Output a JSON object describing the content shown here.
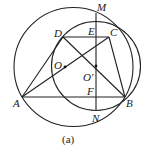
{
  "figure": {
    "caption": "(a)",
    "stroke_color": "#222222",
    "background": "#ffffff",
    "points": {
      "A": {
        "label": "A",
        "x": 22,
        "y": 97
      },
      "B": {
        "label": "B",
        "x": 125,
        "y": 97
      },
      "C": {
        "label": "C",
        "x": 109,
        "y": 37
      },
      "D": {
        "label": "D",
        "x": 63,
        "y": 37
      },
      "E": {
        "label": "E",
        "x": 96,
        "y": 37
      },
      "F": {
        "label": "F",
        "x": 96,
        "y": 97
      },
      "M": {
        "label": "M",
        "x": 96,
        "y": 13
      },
      "N": {
        "label": "N",
        "x": 96,
        "y": 111
      },
      "O": {
        "label": "O",
        "x": 65,
        "y": 67
      },
      "O_prime": {
        "label": "O′",
        "x": 96,
        "y": 66
      }
    },
    "circles": [
      {
        "name": "circle-O",
        "cx": 73.5,
        "cy": 67,
        "r": 59.5
      },
      {
        "name": "circle-O-prime",
        "cx": 96,
        "cy": 66,
        "r": 44.5
      }
    ],
    "segments": [
      "AB",
      "AD",
      "DC",
      "CB",
      "AC",
      "DB",
      "MN"
    ]
  }
}
